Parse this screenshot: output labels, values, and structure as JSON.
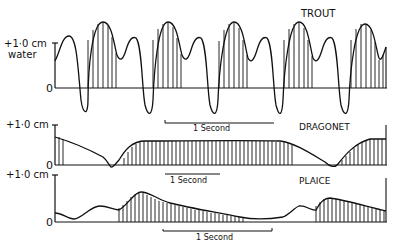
{
  "panels": {
    "trout": {
      "title": "TROUT",
      "y_label_top": "+1·0 cm",
      "y_label_bottom": "water",
      "zero_label": "0",
      "scale_bar": "1 Second"
    },
    "dragonet": {
      "title": "DRAGONET",
      "y_label_top": "+1·0 cm",
      "zero_label": "0",
      "scale_bar": "1 Second"
    },
    "plaice": {
      "title": "PLAICE",
      "y_label_top": "+1·0 cm",
      "zero_label": "0",
      "scale_bar": "1 Second"
    }
  },
  "colors": {
    "ink": "#111111",
    "background": "#ffffff"
  }
}
